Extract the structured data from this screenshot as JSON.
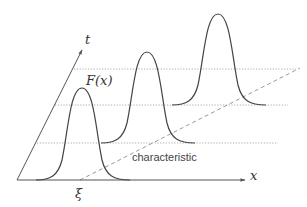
{
  "diagram": {
    "labels": {
      "t_axis": "t",
      "x_axis": "x",
      "function": "F(x)",
      "xi": "ξ",
      "characteristic": "characteristic"
    },
    "colors": {
      "axis": "#555555",
      "curve": "#444444",
      "dotted": "#aaaaaa",
      "dashed": "#999999",
      "text": "#333333"
    },
    "elements": {
      "axes": [
        "t",
        "x"
      ],
      "pulses": [
        {
          "name": "pulse-t0",
          "baseline_y": 180,
          "peak_x": 82,
          "peak_y": 88
        },
        {
          "name": "pulse-t1",
          "baseline_y": 143,
          "peak_x": 147,
          "peak_y": 52
        },
        {
          "name": "pulse-t2",
          "baseline_y": 105,
          "peak_x": 218,
          "peak_y": 14
        }
      ],
      "time_slices": 3,
      "characteristic_line": "dashed, from ξ on the x-axis rising to the right"
    }
  }
}
